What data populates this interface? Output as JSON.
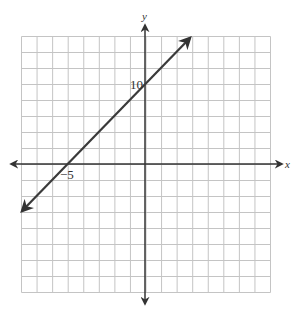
{
  "chart_data": {
    "type": "line",
    "title": "",
    "xlabel": "x",
    "ylabel": "y",
    "equation": "y = 2x + 10",
    "grid": true,
    "grid_columns": 16,
    "grid_rows": 16,
    "x_units_per_cell": 1,
    "y_units_per_cell": 2,
    "xlim": [
      -8,
      8
    ],
    "ylim": [
      -16,
      16
    ],
    "annotations": [
      {
        "text": "10",
        "x": 0,
        "y": 10,
        "meaning": "y-intercept"
      },
      {
        "text": "-5",
        "x": -5,
        "y": 0,
        "meaning": "x-intercept"
      }
    ],
    "series": [
      {
        "name": "line",
        "x": [
          -8,
          3
        ],
        "y": [
          -6,
          16
        ],
        "arrows": "both"
      }
    ]
  },
  "labels": {
    "x_axis": "x",
    "y_axis": "y",
    "y_intercept": "10",
    "x_intercept": "−5"
  },
  "colors": {
    "grid": "#bdbdbd",
    "axis": "#333333",
    "line": "#3a3a3a",
    "background": "#ffffff"
  }
}
